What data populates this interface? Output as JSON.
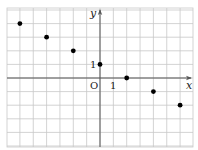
{
  "chart_data": {
    "type": "scatter",
    "title": "",
    "xlabel": "x",
    "ylabel": "y",
    "origin_label": "O",
    "tick_labels": {
      "x": "1",
      "y": "1"
    },
    "grid": true,
    "xlim": [
      -7,
      7
    ],
    "ylim": [
      -5,
      5
    ],
    "series": [
      {
        "name": "points",
        "x": [
          -6,
          -4,
          -2,
          0,
          2,
          4,
          6
        ],
        "y": [
          4,
          3,
          2,
          1,
          0,
          -1,
          -2
        ]
      }
    ]
  },
  "colors": {
    "grid": "#c8c8c8",
    "axis": "#555555",
    "point": "#000000",
    "text": "#222222"
  }
}
